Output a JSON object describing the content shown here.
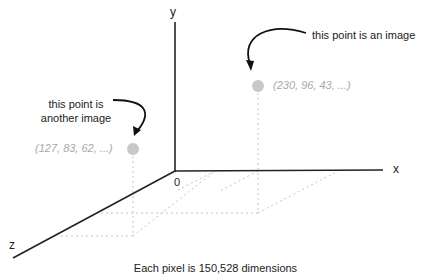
{
  "diagram": {
    "axes": {
      "x": "x",
      "y": "y",
      "z": "z",
      "origin": "0"
    },
    "annotations": {
      "point_a": "this point is an image",
      "point_b_line1": "this point is",
      "point_b_line2": "another image"
    },
    "points": [
      {
        "label": "(230, 96, 43, ...)",
        "color": "#c8c8c8"
      },
      {
        "label": "(127, 83, 62, ...)",
        "color": "#c8c8c8"
      }
    ],
    "caption": "Each pixel is 150,528 dimensions"
  }
}
